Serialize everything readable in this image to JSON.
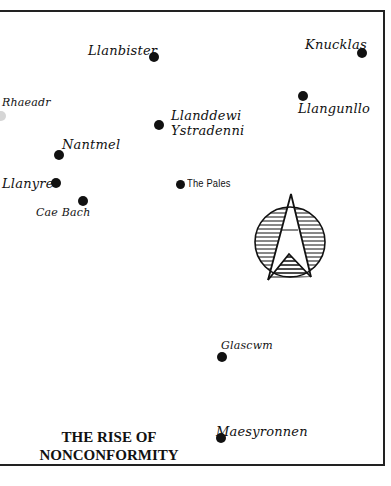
{
  "map": {
    "title_line1": "THE RISE OF",
    "title_line2": "NONCONFORMITY",
    "places": [
      {
        "name": "Llanbister"
      },
      {
        "name": "Knucklas"
      },
      {
        "name": "Rhaeadr"
      },
      {
        "name": "Llanddewi"
      },
      {
        "name": "Ystradenni"
      },
      {
        "name": "Llangunllo"
      },
      {
        "name": "Nantmel"
      },
      {
        "name": "Llanyre"
      },
      {
        "name": "The Pales"
      },
      {
        "name": "Cae Bach"
      },
      {
        "name": "Glascwm"
      },
      {
        "name": "Maesyronnen"
      }
    ],
    "compass": {
      "icon": "north-arrow-icon"
    }
  }
}
